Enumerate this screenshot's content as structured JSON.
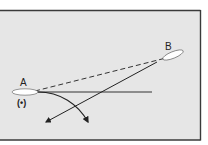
{
  "diagram": {
    "colors": {
      "page_bg": "#ffffff",
      "panel_bg": "#e6e6e6",
      "frame": "#3a3a3a",
      "ink": "#222222",
      "ellipse_fill": "#ffffff"
    },
    "labels": {
      "point_a": "A",
      "point_b": "B",
      "a_marker": "(•)"
    }
  }
}
